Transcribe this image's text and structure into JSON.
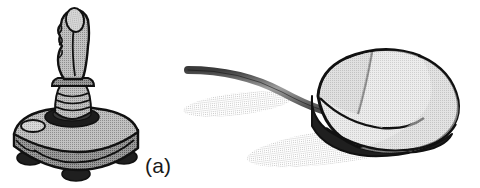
{
  "figure": {
    "background_color": "#ffffff",
    "width": 480,
    "height": 188,
    "style": "grayscale halftone line-art scan",
    "ink_color": "#111111"
  },
  "panels": [
    {
      "id": "a",
      "caption": "(a)",
      "subject": "joystick",
      "icon_name": "joystick-illustration",
      "parts": [
        "contoured-hand-grip",
        "thumb-trigger-button",
        "ribbed-collar",
        "rubber-boot-ring",
        "sloped-base",
        "oval-base-button",
        "rubber-feet"
      ],
      "colors": {
        "body_light": "#b9b9b9",
        "body_mid": "#9a9a9a",
        "body_dark": "#6f6f6f",
        "accent_black": "#1a1a1a"
      }
    },
    {
      "id": "b",
      "caption": "(b)",
      "subject": "computer mouse",
      "icon_name": "mouse-illustration",
      "parts": [
        "oval-shell",
        "left-button",
        "right-button",
        "button-divider",
        "dark-base-band",
        "cable",
        "drop-shadow"
      ],
      "colors": {
        "shell_light": "#e2e2e2",
        "shell_mid": "#cfcfcf",
        "shell_dark": "#a8a8a8",
        "base_black": "#1f1f1f",
        "cable_gray": "#8a8a8a",
        "shadow_gray": "#cccccc"
      }
    }
  ]
}
